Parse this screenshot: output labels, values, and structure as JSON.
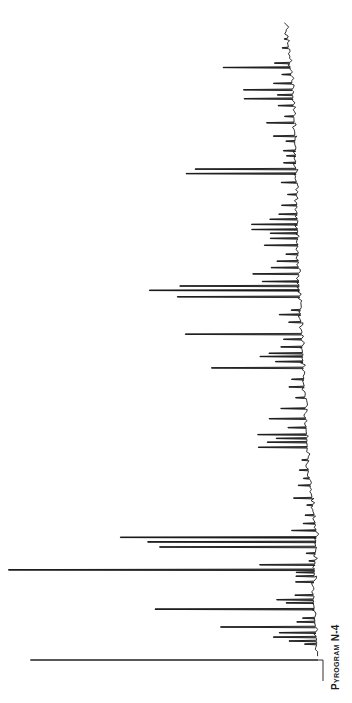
{
  "chart_data": {
    "type": "line",
    "title": "Pyrogram N-4",
    "orientation": "rotated-90 (time runs bottom to top, intensity increases to the left)",
    "xlabel": "",
    "ylabel": "",
    "xlim": [
      0,
      100
    ],
    "ylim": [
      0,
      100
    ],
    "grid": false,
    "legend": "none",
    "line_color": "#1a1a1a",
    "x_unit": "relative retention time",
    "y_unit": "relative intensity (%)",
    "peaks": [
      {
        "t": 0.0,
        "h": 94
      },
      {
        "t": 2.5,
        "h": 4
      },
      {
        "t": 3.0,
        "h": 9
      },
      {
        "t": 3.6,
        "h": 14
      },
      {
        "t": 4.3,
        "h": 12
      },
      {
        "t": 5.2,
        "h": 31
      },
      {
        "t": 6.0,
        "h": 6
      },
      {
        "t": 6.6,
        "h": 4
      },
      {
        "t": 8.0,
        "h": 52
      },
      {
        "t": 9.0,
        "h": 9
      },
      {
        "t": 9.5,
        "h": 12
      },
      {
        "t": 10.2,
        "h": 6
      },
      {
        "t": 12.3,
        "h": 6
      },
      {
        "t": 13.2,
        "h": 6
      },
      {
        "t": 13.8,
        "h": 6
      },
      {
        "t": 14.2,
        "h": 100
      },
      {
        "t": 15.0,
        "h": 18
      },
      {
        "t": 15.6,
        "h": 2
      },
      {
        "t": 16.8,
        "h": 3
      },
      {
        "t": 17.8,
        "h": 51
      },
      {
        "t": 18.6,
        "h": 55
      },
      {
        "t": 19.3,
        "h": 64
      },
      {
        "t": 20.4,
        "h": 8
      },
      {
        "t": 21.5,
        "h": 4
      },
      {
        "t": 22.8,
        "h": 3
      },
      {
        "t": 24.4,
        "h": 2
      },
      {
        "t": 25.5,
        "h": 6
      },
      {
        "t": 27.5,
        "h": 4
      },
      {
        "t": 28.6,
        "h": 2
      },
      {
        "t": 29.9,
        "h": 3
      },
      {
        "t": 31.5,
        "h": 2
      },
      {
        "t": 33.5,
        "h": 16
      },
      {
        "t": 34.3,
        "h": 13
      },
      {
        "t": 34.9,
        "h": 10
      },
      {
        "t": 35.5,
        "h": 16
      },
      {
        "t": 36.6,
        "h": 6
      },
      {
        "t": 38.0,
        "h": 12
      },
      {
        "t": 39.6,
        "h": 8
      },
      {
        "t": 41.3,
        "h": 3
      },
      {
        "t": 43.0,
        "h": 5
      },
      {
        "t": 44.2,
        "h": 4
      },
      {
        "t": 46.0,
        "h": 30
      },
      {
        "t": 47.0,
        "h": 9
      },
      {
        "t": 47.8,
        "h": 14
      },
      {
        "t": 48.3,
        "h": 11
      },
      {
        "t": 49.3,
        "h": 7
      },
      {
        "t": 50.5,
        "h": 6
      },
      {
        "t": 51.3,
        "h": 38
      },
      {
        "t": 53.2,
        "h": 4
      },
      {
        "t": 54.4,
        "h": 7
      },
      {
        "t": 55.1,
        "h": 3
      },
      {
        "t": 57.2,
        "h": 40
      },
      {
        "t": 58.2,
        "h": 49
      },
      {
        "t": 58.9,
        "h": 39
      },
      {
        "t": 59.6,
        "h": 12
      },
      {
        "t": 60.8,
        "h": 15
      },
      {
        "t": 61.8,
        "h": 9
      },
      {
        "t": 62.8,
        "h": 7
      },
      {
        "t": 63.9,
        "h": 4
      },
      {
        "t": 65.3,
        "h": 11
      },
      {
        "t": 66.4,
        "h": 9
      },
      {
        "t": 67.2,
        "h": 9
      },
      {
        "t": 67.8,
        "h": 15
      },
      {
        "t": 68.6,
        "h": 15
      },
      {
        "t": 69.4,
        "h": 9
      },
      {
        "t": 70.2,
        "h": 6
      },
      {
        "t": 71.6,
        "h": 5
      },
      {
        "t": 73.3,
        "h": 3
      },
      {
        "t": 75.2,
        "h": 5
      },
      {
        "t": 76.6,
        "h": 36
      },
      {
        "t": 77.3,
        "h": 33
      },
      {
        "t": 78.3,
        "h": 4
      },
      {
        "t": 79.4,
        "h": 3
      },
      {
        "t": 80.2,
        "h": 4
      },
      {
        "t": 81.7,
        "h": 3
      },
      {
        "t": 82.5,
        "h": 7
      },
      {
        "t": 84.6,
        "h": 9
      },
      {
        "t": 85.6,
        "h": 3
      },
      {
        "t": 87.3,
        "h": 5
      },
      {
        "t": 88.4,
        "h": 16
      },
      {
        "t": 89.0,
        "h": 5
      },
      {
        "t": 89.8,
        "h": 16
      },
      {
        "t": 90.8,
        "h": 6
      },
      {
        "t": 92.2,
        "h": 3
      },
      {
        "t": 93.3,
        "h": 22
      },
      {
        "t": 94.0,
        "h": 5
      },
      {
        "t": 96.4,
        "h": 2
      },
      {
        "t": 97.8,
        "h": 1
      }
    ],
    "baseline_drift": [
      {
        "t": 0,
        "b": 0
      },
      {
        "t": 10,
        "b": 1.5
      },
      {
        "t": 20,
        "b": 0.5
      },
      {
        "t": 30,
        "b": 3
      },
      {
        "t": 40,
        "b": 4
      },
      {
        "t": 50,
        "b": 5
      },
      {
        "t": 60,
        "b": 6
      },
      {
        "t": 70,
        "b": 6.5
      },
      {
        "t": 80,
        "b": 7
      },
      {
        "t": 90,
        "b": 8
      },
      {
        "t": 100,
        "b": 10
      }
    ]
  },
  "caption": "Pyrogram N-4"
}
